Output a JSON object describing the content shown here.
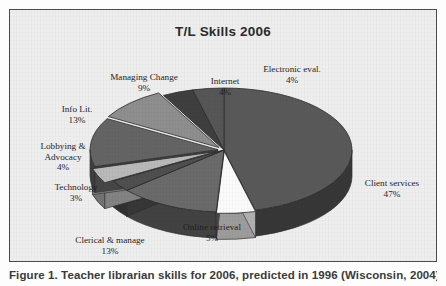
{
  "figure": {
    "caption": "Figure 1. Teacher librarian skills for 2006, predicted in 1996 (Wisconsin, 2004)"
  },
  "chart_data": {
    "type": "pie",
    "title": "T/L Skills 2006",
    "subtitle": "",
    "xlabel": "",
    "ylabel": "",
    "legend_position": "none",
    "grid": false,
    "three_d": true,
    "labels_show_percent": true,
    "start_angle_deg": 0,
    "direction": "clockwise",
    "categories": [
      "Client services",
      "Online retrieval",
      "Clerical & manage",
      "Technology",
      "Lobbying & Advocacy",
      "Info Lit.",
      "Managing Change",
      "Internet",
      "Electronic eval."
    ],
    "values": [
      47,
      5,
      13,
      3,
      4,
      13,
      9,
      4,
      4
    ],
    "value_unit": "%",
    "slices": [
      {
        "label": "Client services",
        "value": 47,
        "value_text": "47%",
        "color": "#595959"
      },
      {
        "label": "Online retrieval",
        "value": 5,
        "value_text": "5%",
        "color": "#fbfbfb"
      },
      {
        "label": "Clerical & manage",
        "value": 13,
        "value_text": "13%",
        "color": "#6a6a6a"
      },
      {
        "label": "Technology",
        "value": 3,
        "value_text": "3%",
        "color": "#4f4f4f"
      },
      {
        "label": "Lobbying & Advocacy",
        "value": 4,
        "value_text": "4%",
        "color": "#b9b9b9"
      },
      {
        "label": "Info Lit.",
        "value": 13,
        "value_text": "13%",
        "color": "#646464"
      },
      {
        "label": "Managing Change",
        "value": 9,
        "value_text": "9%",
        "color": "#8e8e8e"
      },
      {
        "label": "Internet",
        "value": 4,
        "value_text": "4%",
        "color": "#3f3f3f"
      },
      {
        "label": "Electronic eval.",
        "value": 4,
        "value_text": "4%",
        "color": "#565656"
      }
    ]
  },
  "labels": {
    "managing_change": {
      "name": "Managing Change",
      "value": "9%"
    },
    "internet": {
      "name": "Internet",
      "value": "4%"
    },
    "electronic_eval": {
      "name": "Electronic eval.",
      "value": "4%"
    },
    "info_lit": {
      "name": "Info Lit.",
      "value": "13%"
    },
    "lobbying_line1": {
      "name": "Lobbying &"
    },
    "lobbying_line2": {
      "name": "Advocacy",
      "value": "4%"
    },
    "technology": {
      "name": "Technology",
      "value": "3%"
    },
    "clerical": {
      "name": "Clerical & manage",
      "value": "13%"
    },
    "online_retrieval": {
      "name": "Online retrieval",
      "value": "5%"
    },
    "client_services": {
      "name": "Client services",
      "value": "47%"
    }
  }
}
